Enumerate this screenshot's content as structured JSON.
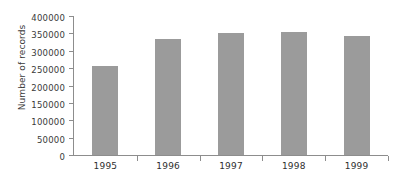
{
  "chart_data": {
    "type": "bar",
    "title": "",
    "xlabel": "",
    "ylabel": "Number of records",
    "categories": [
      "1995",
      "1996",
      "1997",
      "1998",
      "1999"
    ],
    "values": [
      255000,
      333000,
      351000,
      353000,
      343000
    ],
    "ylim": [
      0,
      400000
    ],
    "y_ticks": [
      0,
      50000,
      100000,
      150000,
      200000,
      250000,
      300000,
      350000,
      400000
    ],
    "y_tick_labels": [
      "0",
      "50000",
      "100000",
      "150000",
      "200000",
      "250000",
      "300000",
      "350000",
      "400000"
    ],
    "grid": false,
    "legend": false,
    "bar_color": "#9b9b9b",
    "axis_color": "#8d8d8d",
    "text_color": "#3a3a3a"
  }
}
